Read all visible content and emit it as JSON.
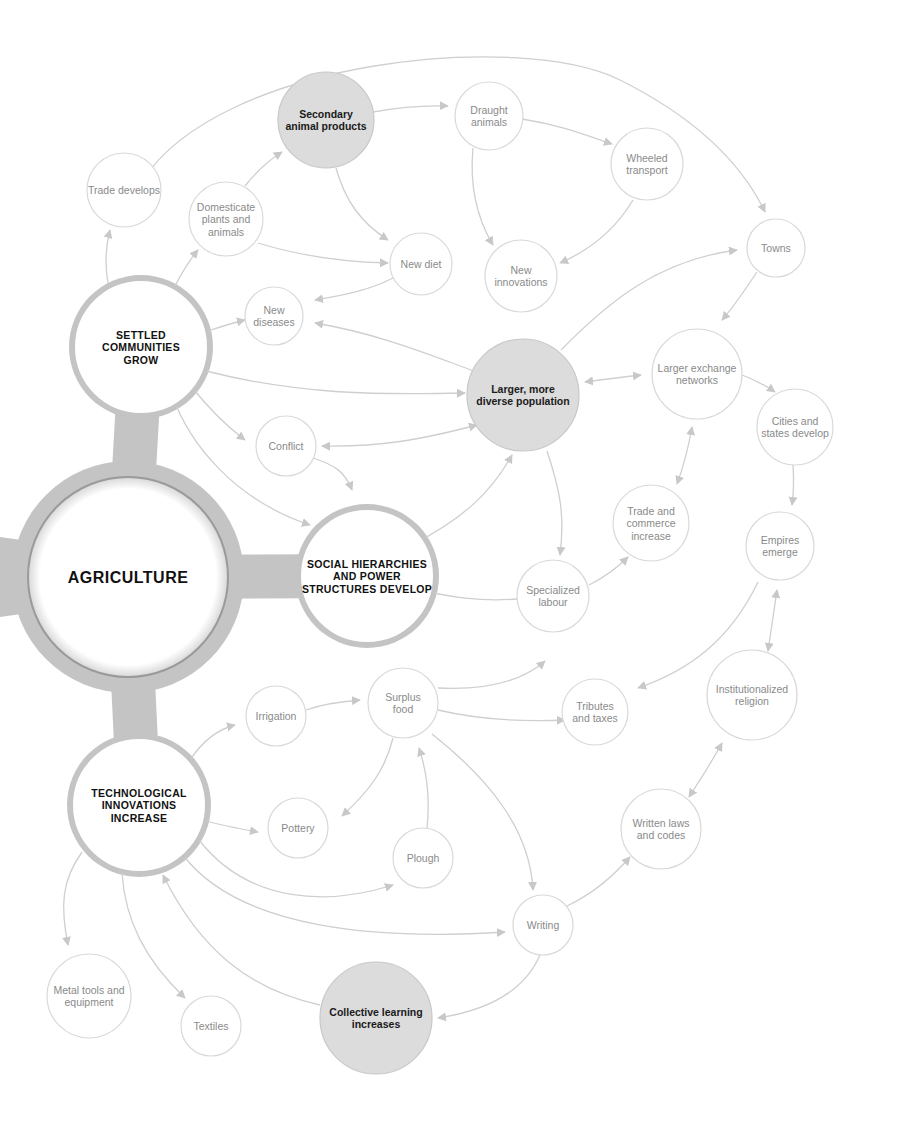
{
  "diagram": {
    "colors": {
      "edge": "#cfcfcf",
      "node_stroke": "#d9d9d9",
      "shaded_fill": "#dcdcdc",
      "hub_frame": "#c4c4c4",
      "text_light": "#8a8a8a",
      "text_dark": "#111111"
    },
    "center": {
      "id": "agriculture",
      "label": "AGRICULTURE",
      "x": 128,
      "y": 577,
      "r": 100
    },
    "hubs": [
      {
        "id": "settled",
        "lines": [
          "SETTLED",
          "COMMUNITIES",
          "GROW"
        ],
        "x": 141,
        "y": 347,
        "r": 68
      },
      {
        "id": "social",
        "lines": [
          "SOCIAL HIERARCHIES",
          "AND POWER",
          "STRUCTURES DEVELOP"
        ],
        "x": 367,
        "y": 576,
        "r": 68
      },
      {
        "id": "tech",
        "lines": [
          "TECHNOLOGICAL",
          "INNOVATIONS",
          "INCREASE"
        ],
        "x": 139,
        "y": 805,
        "r": 68
      }
    ],
    "shaded_nodes": [
      {
        "id": "secondary",
        "lines": [
          "Secondary",
          "animal products"
        ],
        "x": 326,
        "y": 120,
        "r": 48
      },
      {
        "id": "population",
        "lines": [
          "Larger, more",
          "diverse population"
        ],
        "x": 523,
        "y": 395,
        "r": 56
      },
      {
        "id": "collective",
        "lines": [
          "Collective learning",
          "increases"
        ],
        "x": 376,
        "y": 1018,
        "r": 56
      }
    ],
    "nodes": [
      {
        "id": "trade_develops",
        "lines": [
          "Trade develops"
        ],
        "x": 124,
        "y": 190,
        "r": 37
      },
      {
        "id": "domesticate",
        "lines": [
          "Domesticate",
          "plants and",
          "animals"
        ],
        "x": 226,
        "y": 219,
        "r": 37
      },
      {
        "id": "new_diet",
        "lines": [
          "New diet"
        ],
        "x": 421,
        "y": 264,
        "r": 31
      },
      {
        "id": "new_diseases",
        "lines": [
          "New",
          "diseases"
        ],
        "x": 274,
        "y": 316,
        "r": 29
      },
      {
        "id": "draught",
        "lines": [
          "Draught",
          "animals"
        ],
        "x": 489,
        "y": 116,
        "r": 34
      },
      {
        "id": "wheeled",
        "lines": [
          "Wheeled",
          "transport"
        ],
        "x": 647,
        "y": 164,
        "r": 36
      },
      {
        "id": "new_innovations",
        "lines": [
          "New",
          "innovations"
        ],
        "x": 521,
        "y": 276,
        "r": 36
      },
      {
        "id": "towns",
        "lines": [
          "Towns"
        ],
        "x": 776,
        "y": 248,
        "r": 29
      },
      {
        "id": "conflict",
        "lines": [
          "Conflict"
        ],
        "x": 286,
        "y": 446,
        "r": 30
      },
      {
        "id": "larger_exchange",
        "lines": [
          "Larger exchange",
          "networks"
        ],
        "x": 697,
        "y": 374,
        "r": 45
      },
      {
        "id": "cities",
        "lines": [
          "Cities and",
          "states develop"
        ],
        "x": 795,
        "y": 427,
        "r": 38
      },
      {
        "id": "trade_commerce",
        "lines": [
          "Trade and",
          "commerce",
          "increase"
        ],
        "x": 651,
        "y": 523,
        "r": 38
      },
      {
        "id": "empires",
        "lines": [
          "Empires",
          "emerge"
        ],
        "x": 780,
        "y": 546,
        "r": 34
      },
      {
        "id": "specialized",
        "lines": [
          "Specialized",
          "labour"
        ],
        "x": 553,
        "y": 596,
        "r": 36
      },
      {
        "id": "irrigation",
        "lines": [
          "Irrigation"
        ],
        "x": 276,
        "y": 716,
        "r": 30
      },
      {
        "id": "surplus",
        "lines": [
          "Surplus",
          "food"
        ],
        "x": 403,
        "y": 703,
        "r": 35
      },
      {
        "id": "tributes",
        "lines": [
          "Tributes",
          "and taxes"
        ],
        "x": 595,
        "y": 712,
        "r": 33
      },
      {
        "id": "religion",
        "lines": [
          "Institutionalized",
          "religion"
        ],
        "x": 752,
        "y": 695,
        "r": 45
      },
      {
        "id": "pottery",
        "lines": [
          "Pottery"
        ],
        "x": 298,
        "y": 828,
        "r": 30
      },
      {
        "id": "plough",
        "lines": [
          "Plough"
        ],
        "x": 423,
        "y": 858,
        "r": 30
      },
      {
        "id": "written_laws",
        "lines": [
          "Written laws",
          "and codes"
        ],
        "x": 661,
        "y": 829,
        "r": 40
      },
      {
        "id": "writing",
        "lines": [
          "Writing"
        ],
        "x": 543,
        "y": 925,
        "r": 30
      },
      {
        "id": "metal_tools",
        "lines": [
          "Metal tools and",
          "equipment"
        ],
        "x": 89,
        "y": 996,
        "r": 42
      },
      {
        "id": "textiles",
        "lines": [
          "Textiles"
        ],
        "x": 211,
        "y": 1026,
        "r": 30
      }
    ],
    "edges": [
      {
        "d": "M108,283 C104,260 106,245 110,230",
        "end": true,
        "start": false
      },
      {
        "d": "M174,288 C182,272 188,262 198,250",
        "end": true,
        "start": false
      },
      {
        "d": "M245,186 C256,172 266,162 282,152",
        "end": true,
        "start": false
      },
      {
        "d": "M258,243 C300,256 345,262 388,263",
        "end": true,
        "start": false
      },
      {
        "d": "M336,168 C345,200 360,222 388,240",
        "end": true,
        "start": false
      },
      {
        "d": "M393,278 C370,290 345,295 315,300",
        "end": true,
        "start": false
      },
      {
        "d": "M208,331 C220,327 232,323 245,320",
        "end": true,
        "start": false
      },
      {
        "d": "M474,371 C430,355 380,334 315,323",
        "end": true,
        "start": false
      },
      {
        "d": "M206,371 C300,395 380,395 465,393",
        "end": true,
        "start": false
      },
      {
        "d": "M373,112 C400,107 420,105 448,106",
        "end": true,
        "start": false
      },
      {
        "d": "M522,119 C560,125 585,135 612,144",
        "end": true,
        "start": false
      },
      {
        "d": "M473,148 C470,180 475,215 493,245",
        "end": true,
        "start": false
      },
      {
        "d": "M633,200 C615,230 590,250 560,263",
        "end": true,
        "start": false
      },
      {
        "d": "M143,180 C220,60 520,30 620,80 C690,115 740,160 765,212",
        "end": true,
        "start": false
      },
      {
        "d": "M561,350 C610,300 660,260 737,250",
        "end": true,
        "start": false
      },
      {
        "d": "M757,272 C745,290 735,305 722,320",
        "end": true,
        "start": false
      },
      {
        "d": "M585,382 C600,380 615,378 641,375",
        "end": true,
        "start": true
      },
      {
        "d": "M742,375 C755,380 765,385 775,392",
        "end": true,
        "start": false
      },
      {
        "d": "M793,465 C794,480 794,490 792,505",
        "end": true,
        "start": false
      },
      {
        "d": "M692,427 C688,450 684,465 677,484",
        "end": true,
        "start": true
      },
      {
        "d": "M190,385 C210,410 225,425 245,440",
        "end": true,
        "start": false
      },
      {
        "d": "M477,425 C420,440 380,447 322,446",
        "end": true,
        "start": true
      },
      {
        "d": "M313,458 C335,465 345,472 352,490",
        "end": true,
        "start": false
      },
      {
        "d": "M172,395 C190,445 235,500 310,525",
        "end": true,
        "start": false
      },
      {
        "d": "M512,455 C490,495 460,520 412,545",
        "end": true,
        "start": true
      },
      {
        "d": "M547,451 C560,490 565,515 560,555",
        "end": true,
        "start": false
      },
      {
        "d": "M517,599 C480,602 450,597 415,589",
        "end": true,
        "start": false
      },
      {
        "d": "M589,585 C605,577 615,570 628,557",
        "end": true,
        "start": false
      },
      {
        "d": "M758,582 C730,640 690,670 638,688",
        "end": true,
        "start": false
      },
      {
        "d": "M777,590 C774,610 772,625 768,651",
        "end": true,
        "start": true
      },
      {
        "d": "M438,688 C480,690 520,683 545,661",
        "end": true,
        "start": false
      },
      {
        "d": "M438,710 C480,720 520,722 565,720",
        "end": true,
        "start": false
      },
      {
        "d": "M306,710 C320,705 335,702 360,700",
        "end": true,
        "start": false
      },
      {
        "d": "M190,760 C200,745 215,730 235,725",
        "end": true,
        "start": false
      },
      {
        "d": "M393,738 C385,770 370,790 342,816",
        "end": true,
        "start": false
      },
      {
        "d": "M427,828 C430,800 428,775 419,748",
        "end": true,
        "start": false
      },
      {
        "d": "M207,821 C220,825 235,828 258,832",
        "end": true,
        "start": false
      },
      {
        "d": "M199,840 C250,905 330,905 393,885",
        "end": true,
        "start": false
      },
      {
        "d": "M432,734 C490,780 530,830 533,890",
        "end": true,
        "start": false
      },
      {
        "d": "M183,855 C240,930 380,940 505,932",
        "end": true,
        "start": false
      },
      {
        "d": "M567,906 C590,895 610,880 630,857",
        "end": true,
        "start": false
      },
      {
        "d": "M689,797 C700,780 710,765 722,743",
        "end": true,
        "start": true
      },
      {
        "d": "M540,955 C525,990 490,1010 438,1018",
        "end": true,
        "start": false
      },
      {
        "d": "M320,1005 C250,990 200,950 163,875",
        "end": true,
        "start": false
      },
      {
        "d": "M82,852 C62,880 60,905 68,945",
        "end": true,
        "start": false
      },
      {
        "d": "M122,873 C125,920 145,960 185,998",
        "end": true,
        "start": false
      }
    ]
  }
}
